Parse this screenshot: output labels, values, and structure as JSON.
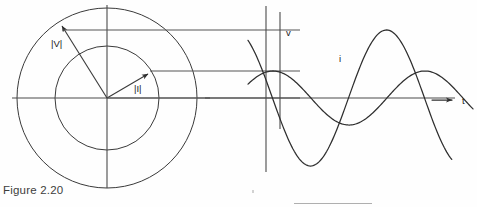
{
  "figure": {
    "caption": "Figure 2.20",
    "background_color": "#fefefe",
    "ink_color": "#2e2e2e"
  },
  "phasor_diagram": {
    "name": "rotating-phasor-diagram",
    "center": {
      "x": 107,
      "y": 98
    },
    "outer_circle_radius": 90,
    "inner_circle_radius": 52,
    "horizontal_axis": {
      "x1": 12,
      "y1": 98,
      "x2": 210,
      "y2": 98
    },
    "vertical_axis": {
      "x1": 107,
      "y1": 5,
      "x2": 107,
      "y2": 188
    },
    "phasors": [
      {
        "label": "|V|",
        "magnitude_ratio": 1.0,
        "angle_degrees": 122,
        "tip": {
          "x": 59,
          "y": 22
        },
        "label_position": {
          "x": 53,
          "y": 44
        },
        "circle": "outer"
      },
      {
        "label": "|I|",
        "magnitude_ratio": 0.578,
        "angle_degrees": 31,
        "tip": {
          "x": 152,
          "y": 71
        },
        "label_position": {
          "x": 136,
          "y": 89
        },
        "circle": "inner"
      }
    ]
  },
  "projection_lines": [
    {
      "name": "v-peak-projection",
      "y": 30,
      "x1": 59,
      "x2": 300
    },
    {
      "name": "i-peak-projection",
      "y": 71,
      "x1": 152,
      "x2": 300
    },
    {
      "name": "zero-axis-projection",
      "y": 98,
      "x1": 107,
      "x2": 300
    }
  ],
  "time_axis": {
    "label": "t",
    "y": 98,
    "x1": 205,
    "x2": 455,
    "arrow": {
      "x1": 432,
      "x2": 456,
      "y": 100
    },
    "label_position": {
      "x": 464,
      "y": 104
    }
  },
  "vertical_reference_lines": [
    {
      "name": "v-phase-reference-line",
      "x": 266,
      "y1": 6,
      "y2": 172
    },
    {
      "name": "i-phase-reference-line",
      "x": 280,
      "y1": 12,
      "y2": 129
    }
  ],
  "chart_data": {
    "type": "line",
    "title": "Figure 2.20",
    "xlabel": "t",
    "ylabel": "",
    "grid": false,
    "legend": "inline-labels",
    "x_axis_zero_y": 98,
    "x_range": [
      248,
      477
    ],
    "series": [
      {
        "name": "v",
        "label": "v",
        "label_position": {
          "x": 288,
          "y": 34
        },
        "amplitude": 68,
        "amplitude_y_peak": 30,
        "wavelength_px": 152,
        "phase_degrees": 122,
        "start_x": 248,
        "end_x": 452,
        "description": "voltage sinusoid, leads current"
      },
      {
        "name": "i",
        "label": "i",
        "label_position": {
          "x": 341,
          "y": 60
        },
        "amplitude": 27,
        "amplitude_y_peak": 71,
        "wavelength_px": 152,
        "phase_degrees": 31,
        "start_x": 248,
        "end_x": 474,
        "description": "current sinusoid, lags voltage"
      }
    ]
  },
  "labels": {
    "voltage_magnitude": "|V|",
    "current_magnitude": "|I|",
    "voltage_wave": "v",
    "current_wave": "i",
    "time_axis": "t"
  }
}
